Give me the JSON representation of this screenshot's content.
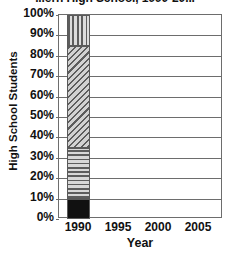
{
  "chart_data": {
    "type": "bar",
    "subtype": "stacked-bar-percent",
    "title": "...ern High School, 1990-20...",
    "title_note": "title is cropped off the top edge of the screenshot",
    "xlabel": "Year",
    "ylabel": "High School Students",
    "categories": [
      "1990"
    ],
    "x_tick_labels": [
      "1990",
      "1995",
      "2000",
      "2005"
    ],
    "y_tick_labels": [
      "0%",
      "10%",
      "20%",
      "30%",
      "40%",
      "50%",
      "60%",
      "70%",
      "80%",
      "90%",
      "100%"
    ],
    "ylim": [
      0,
      100
    ],
    "y_tick_step": 10,
    "grid": "horizontal",
    "legend": "none",
    "series": [
      {
        "name": "segment-1-bottom",
        "pattern": "solid-black",
        "values": [
          10
        ],
        "range": [
          0,
          10
        ],
        "color": "#111111"
      },
      {
        "name": "segment-2",
        "pattern": "horizontal-stripes",
        "values": [
          25
        ],
        "range": [
          10,
          35
        ],
        "color": "#c9c9c9"
      },
      {
        "name": "segment-3",
        "pattern": "diagonal-hatch",
        "values": [
          50
        ],
        "range": [
          35,
          85
        ],
        "color": "#c4c4c4"
      },
      {
        "name": "segment-4-top",
        "pattern": "vertical-stripes",
        "values": [
          15
        ],
        "range": [
          85,
          100
        ],
        "color": "#c9c9c9"
      }
    ]
  },
  "axes": {
    "y_ticks": [
      {
        "label": "100%",
        "value": 100
      },
      {
        "label": "90%",
        "value": 90
      },
      {
        "label": "80%",
        "value": 80
      },
      {
        "label": "70%",
        "value": 70
      },
      {
        "label": "60%",
        "value": 60
      },
      {
        "label": "50%",
        "value": 50
      },
      {
        "label": "40%",
        "value": 40
      },
      {
        "label": "30%",
        "value": 30
      },
      {
        "label": "20%",
        "value": 20
      },
      {
        "label": "10%",
        "value": 10
      },
      {
        "label": "0%",
        "value": 0
      }
    ],
    "x_ticks": [
      {
        "label": "1990",
        "center_px": 78
      },
      {
        "label": "1995",
        "center_px": 118
      },
      {
        "label": "2000",
        "center_px": 158
      },
      {
        "label": "2005",
        "center_px": 198
      }
    ]
  }
}
